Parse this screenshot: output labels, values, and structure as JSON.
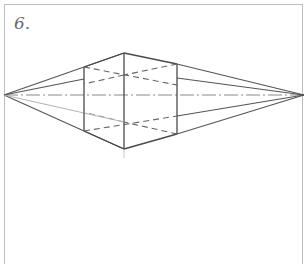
{
  "figure": {
    "label": "6.",
    "colors": {
      "frame": "#bdbdbd",
      "line": "#555555",
      "hidden_line": "#666666",
      "guide_line": "#9a9a9a",
      "label": "#6a6a6a"
    },
    "vanishing_points": {
      "left": [
        4,
        95
      ],
      "right": [
        304,
        95
      ]
    },
    "box": {
      "near_vertical": {
        "x": 124,
        "top": 53,
        "bottom": 149
      },
      "left_vertical": {
        "x": 84,
        "top": 67,
        "bottom": 131
      },
      "right_vertical": {
        "x": 177,
        "top": 64,
        "bottom": 134
      }
    }
  }
}
